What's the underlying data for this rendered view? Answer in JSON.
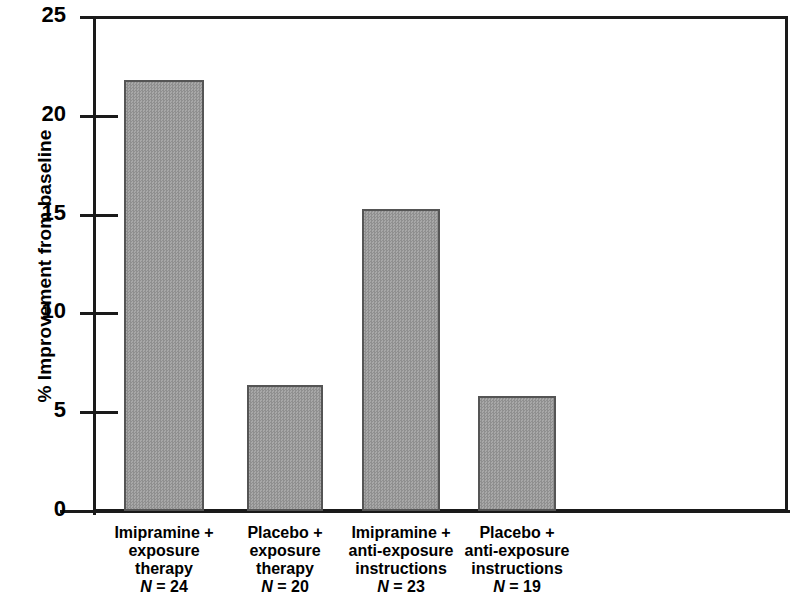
{
  "chart_data": {
    "type": "bar",
    "title": "",
    "xlabel": "",
    "ylabel": "% Improvement from baseline",
    "ylim": [
      0,
      25
    ],
    "yticks": [
      0,
      5,
      10,
      15,
      20,
      25
    ],
    "ytick_labels": [
      "0",
      "5",
      "10",
      "15",
      "20",
      "25"
    ],
    "grid": false,
    "legend": null,
    "categories": [
      "Imipramine + exposure therapy",
      "Placebo + exposure therapy",
      "Imipramine + anti-exposure instructions",
      "Placebo + anti-exposure instructions"
    ],
    "values": [
      21.8,
      6.4,
      15.3,
      5.8
    ],
    "bar_color": "#9d9d9d",
    "bar_edge_color": "#555555",
    "axis_color": "#1a1a1a"
  },
  "axis": {
    "y_title": "% Improvement from baseline",
    "ticks": [
      {
        "label": "25",
        "value": 25
      },
      {
        "label": "20",
        "value": 20
      },
      {
        "label": "15",
        "value": 15
      },
      {
        "label": "10",
        "value": 10
      },
      {
        "label": "5",
        "value": 5
      },
      {
        "label": "0",
        "value": 0
      }
    ]
  },
  "categories": [
    {
      "lines": [
        "Imipramine +",
        "exposure",
        "therapy"
      ],
      "n_prefix": "N",
      "n_value": " = 24",
      "n_text": "N = 24"
    },
    {
      "lines": [
        "Placebo +",
        "exposure",
        "therapy"
      ],
      "n_prefix": "N",
      "n_value": " = 20",
      "n_text": "N = 20"
    },
    {
      "lines": [
        "Imipramine +",
        "anti-exposure",
        "instructions"
      ],
      "n_prefix": "N",
      "n_value": " = 23",
      "n_text": "N = 23"
    },
    {
      "lines": [
        "Placebo +",
        "anti-exposure",
        "instructions"
      ],
      "n_prefix": "N",
      "n_value": " = 19",
      "n_text": "N = 19"
    }
  ]
}
